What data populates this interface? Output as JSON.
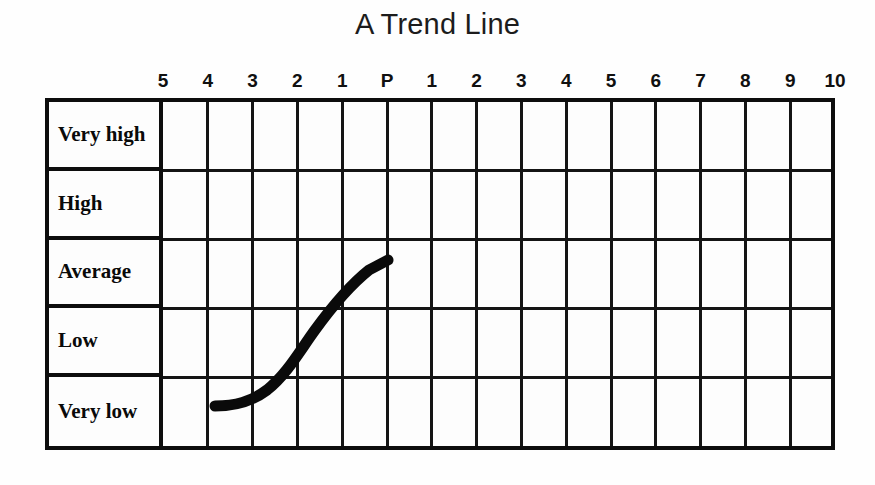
{
  "title": "A Trend Line",
  "columns": {
    "labels": [
      "5",
      "4",
      "3",
      "2",
      "1",
      "P",
      "1",
      "2",
      "3",
      "4",
      "5",
      "6",
      "7",
      "8",
      "9",
      "10"
    ]
  },
  "rows": {
    "labels": [
      "Very high",
      "High",
      "Average",
      "Low",
      "Very low"
    ]
  },
  "colors": {
    "grid_line": "#141414",
    "border": "#0d0d0d",
    "trend_line": "#0a0a0a",
    "background": "#fdfdfd",
    "title_text": "#1c1c1c"
  },
  "chart_data": {
    "type": "line",
    "title": "A Trend Line",
    "xlabel": "",
    "ylabel": "",
    "grid": true,
    "legend": null,
    "x_tick_labels": [
      "5",
      "4",
      "3",
      "2",
      "1",
      "P",
      "1",
      "2",
      "3",
      "4",
      "5",
      "6",
      "7",
      "8",
      "9",
      "10"
    ],
    "x_tick_meaning": "Periods before the present (5..1), the Present (P), then periods after the present (1..10)",
    "y_tick_labels": [
      "Very high",
      "High",
      "Average",
      "Low",
      "Very low"
    ],
    "y_categories_top_to_bottom": [
      "Very high",
      "High",
      "Average",
      "Low",
      "Very low"
    ],
    "series": [
      {
        "name": "Trend",
        "points": [
          {
            "x": "4",
            "y": "Very low"
          },
          {
            "x": "3",
            "y": "Very low"
          },
          {
            "x": "2",
            "y": "Low"
          },
          {
            "x": "1",
            "y": "Low/Average boundary"
          },
          {
            "x": "P",
            "y": "Average"
          }
        ],
        "description": "Hand-drawn thick black curve rising from Very low at period 4 before the present, through Low, reaching Average at the Present (P); no data is drawn after the present."
      }
    ]
  }
}
